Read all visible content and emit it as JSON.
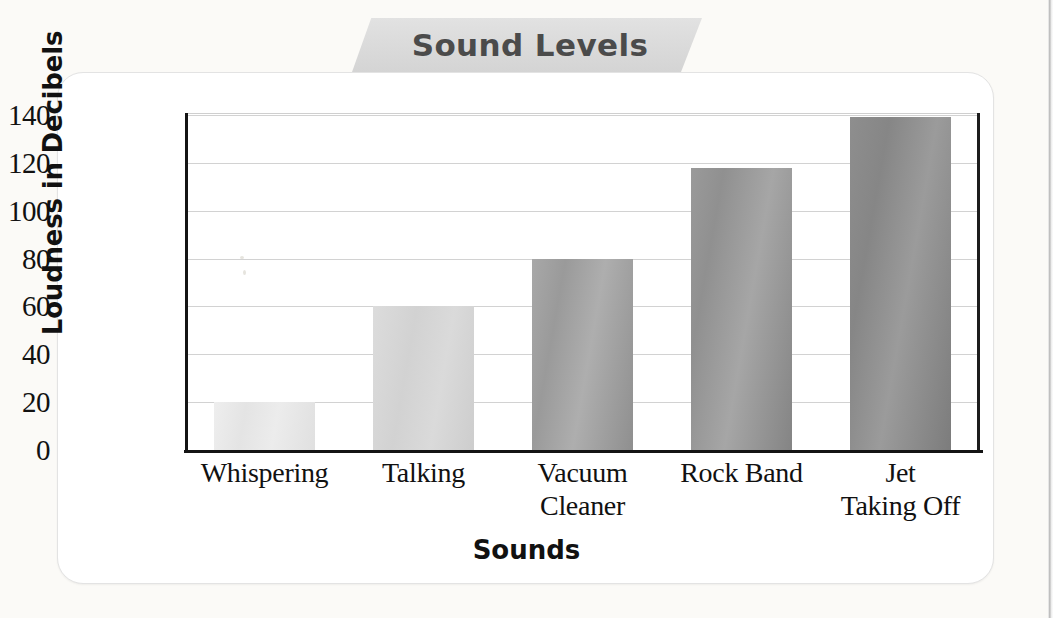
{
  "title": "Sound Levels",
  "chart_data": {
    "type": "bar",
    "title": "Sound Levels",
    "xlabel": "Sounds",
    "ylabel": "Loudness in Decibels",
    "categories": [
      "Whispering",
      "Talking",
      "Vacuum\nCleaner",
      "Rock Band",
      "Jet\nTaking Off"
    ],
    "category_lines": [
      [
        "Whispering"
      ],
      [
        "Talking"
      ],
      [
        "Vacuum",
        "Cleaner"
      ],
      [
        "Rock Band"
      ],
      [
        "Jet",
        "Taking Off"
      ]
    ],
    "values": [
      20,
      60,
      80,
      118,
      139
    ],
    "ylim": [
      0,
      140
    ],
    "ytick_labels": [
      "0",
      "20",
      "40",
      "60",
      "80",
      "100",
      "120",
      "140"
    ],
    "ytick_values": [
      0,
      20,
      40,
      60,
      80,
      100,
      120,
      140
    ],
    "grid": true,
    "legend": "none",
    "bar_colors": [
      "#e8e8e8",
      "#d5d5d5",
      "#9e9e9e",
      "#949494",
      "#898989"
    ]
  },
  "colors": {
    "banner_fill": "#dcdcdc",
    "banner_text": "#4b4b4b",
    "axis": "#141414",
    "gridline": "#d2d2d2",
    "card_border": "#e3e3e3",
    "page_background": "#fbfaf7"
  }
}
